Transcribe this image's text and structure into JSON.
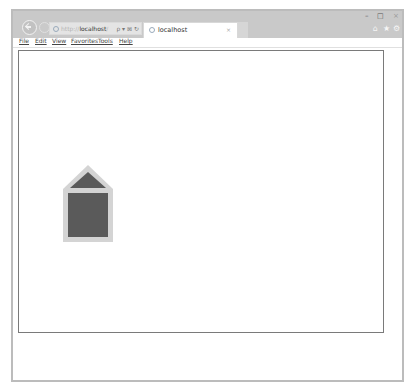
{
  "browser": {
    "address_bar": {
      "protocol": "http://",
      "host": "localhost",
      "path": "/",
      "icons": [
        "search-icon",
        "dropdown-icon",
        "compat-view-icon",
        "refresh-icon"
      ],
      "icon_glyphs": "ρ ▾ ⊠ ↻"
    },
    "tabs": [
      {
        "label": "localhost",
        "active": true,
        "close_glyph": "×"
      }
    ],
    "window_controls": {
      "minimize": "–",
      "maximize": "□",
      "close": "×"
    },
    "toolbar_icons": {
      "home": "⌂",
      "favorites": "★",
      "tools": "⚙"
    },
    "menu": [
      "File",
      "Edit",
      "View",
      "Favorites",
      "Tools",
      "Help"
    ]
  },
  "page": {
    "shape": {
      "type": "house",
      "outline_color": "#d4d4d4",
      "fill_color": "#5a5a5a"
    }
  }
}
